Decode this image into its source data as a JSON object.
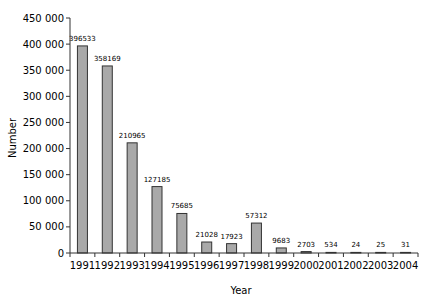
{
  "chart_data": {
    "type": "bar",
    "title": "",
    "xlabel": "Year",
    "ylabel": "Number",
    "ylim": [
      0,
      450000
    ],
    "yticks": [
      "0",
      "50 000",
      "100 000",
      "150 000",
      "200 000",
      "250 000",
      "300 000",
      "350 000",
      "400 000",
      "450 000"
    ],
    "categories": [
      "1991",
      "1992",
      "1993",
      "1994",
      "1995",
      "1996",
      "1997",
      "1998",
      "1999",
      "2000",
      "2001",
      "2002",
      "2003",
      "2004"
    ],
    "values": [
      396533,
      358169,
      210965,
      127185,
      75685,
      21028,
      17923,
      57312,
      9683,
      2703,
      534,
      24,
      25,
      31
    ],
    "data_labels": [
      "396533",
      "358169",
      "210965",
      "127185",
      "75685",
      "21028",
      "17923",
      "57312",
      "9683",
      "2703",
      "534",
      "24",
      "25",
      "31"
    ],
    "bar_color": "#a9a9a9",
    "bar_edge_color": "#333333",
    "grid": false,
    "legend": null
  }
}
